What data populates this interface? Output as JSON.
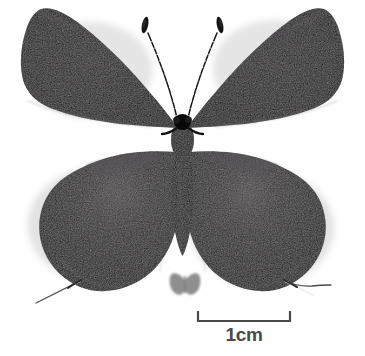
{
  "image": {
    "kind": "specimen-photograph",
    "subject": "butterfly",
    "view": "dorsal",
    "background_color": "#fefefe"
  },
  "specimen": {
    "name": "butterfly-specimen",
    "body": {
      "head_name": "butterfly-head",
      "thorax_name": "butterfly-thorax",
      "abdomen_name": "butterfly-abdomen",
      "color": "#0a0a0a"
    },
    "antennae": {
      "left_name": "left-antenna",
      "right_name": "right-antenna",
      "shaft_color": "#1a1a1a",
      "club_color": "#141414",
      "banded": "true"
    },
    "wings": {
      "forewing_left_name": "left-forewing",
      "forewing_right_name": "right-forewing",
      "hindwing_left_name": "left-hindwing",
      "hindwing_right_name": "right-hindwing",
      "forewing_color": "#151414",
      "hindwing_color": "#232122",
      "sheen_color": "#4a4648"
    },
    "tails": {
      "left_name": "left-hindwing-tail",
      "right_name": "right-hindwing-tail",
      "color": "#3c3a3b"
    }
  },
  "thumbnail": {
    "name": "butterfly-silhouette-thumbnail",
    "color": "#8f8f8f"
  },
  "scale_bar": {
    "name": "scale-bar",
    "label": "1cm",
    "length_px": 94,
    "unit": "cm",
    "value": 1,
    "color": "#4a4a4a",
    "left_tick_name": "scale-bar-left-tick",
    "right_tick_name": "scale-bar-right-tick"
  }
}
